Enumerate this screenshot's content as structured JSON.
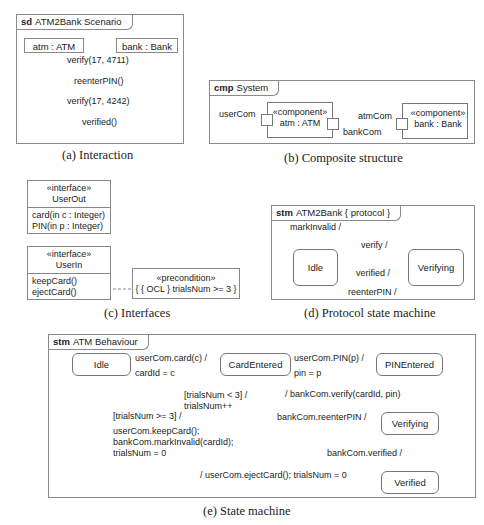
{
  "interaction": {
    "kind": "sd",
    "title": "ATM2Bank Scenario",
    "lifelines": [
      "atm : ATM",
      "bank : Bank"
    ],
    "messages": [
      {
        "label": "verify(17, 4711)",
        "direction": "atm->bank"
      },
      {
        "label": "reenterPIN()",
        "direction": "bank->atm"
      },
      {
        "label": "verify(17, 4242)",
        "direction": "atm->bank"
      },
      {
        "label": "verified()",
        "direction": "bank->atm"
      }
    ],
    "caption": "(a) Interaction"
  },
  "composite": {
    "kind": "cmp",
    "title": "System",
    "components": [
      {
        "stereotype": "«component»",
        "name": "atm : ATM"
      },
      {
        "stereotype": "«component»",
        "name": "bank : Bank"
      }
    ],
    "ports": {
      "user": "userCom",
      "atm_bank": "atmCom",
      "bank": "bankCom"
    },
    "caption": "(b) Composite structure"
  },
  "interfaces": {
    "items": [
      {
        "stereotype": "«interface»",
        "name": "UserOut",
        "ops": [
          "card(in c : Integer)",
          "PIN(in p : Integer)"
        ]
      },
      {
        "stereotype": "«interface»",
        "name": "UserIn",
        "ops": [
          "keepCard()",
          "ejectCard()"
        ]
      }
    ],
    "note": {
      "stereotype": "«precondition»",
      "text": "{ { OCL } trialsNum >= 3 }"
    },
    "caption": "(c) Interfaces"
  },
  "protocol": {
    "kind": "stm",
    "title": "ATM2Bank { protocol }",
    "states": [
      "Idle",
      "Verifying"
    ],
    "transitions": {
      "self": "markInvalid /",
      "verify": "verify /",
      "verified": "verified /",
      "reenter": "reenterPIN /"
    },
    "caption": "(d) Protocol state machine"
  },
  "behaviour": {
    "kind": "stm",
    "title": "ATM Behaviour",
    "states": {
      "idle": "Idle",
      "card": "CardEntered",
      "pin": "PINEntered",
      "verifying": "Verifying",
      "verified": "Verified"
    },
    "transitions": {
      "card_trigger": "userCom.card(c) /",
      "card_effect": "cardId = c",
      "pin_trigger": "userCom.PIN(p) /",
      "pin_effect": "pin = p",
      "verify": "/ bankCom.verify(cardId, pin)",
      "reenter": "bankCom.reenterPIN /",
      "retry_guard": "[trialsNum < 3] /",
      "retry_effect": "trialsNum++",
      "fail_guard": "[trialsNum >= 3] /",
      "fail_effect1": "userCom.keepCard();",
      "fail_effect2": "bankCom.markInvalid(cardId);",
      "fail_effect3": "trialsNum = 0",
      "verified": "bankCom.verified /",
      "eject": "/ userCom.ejectCard(); trialsNum = 0"
    },
    "caption": "(e) State machine"
  }
}
